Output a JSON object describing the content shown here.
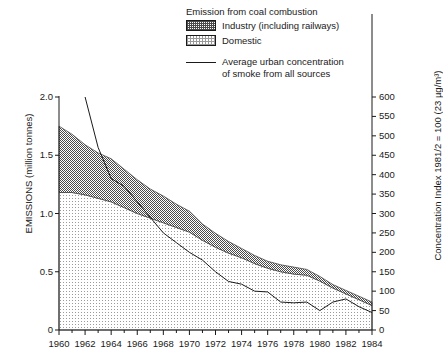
{
  "legend": {
    "title": "Emission from coal combustion",
    "items": [
      {
        "label": "Industry (including railways)",
        "swatch": "industry-pattern-swatch"
      },
      {
        "label": "Domestic",
        "swatch": "domestic-pattern-swatch"
      }
    ],
    "line_label_line1": "Average urban concentration",
    "line_label_line2": "of smoke from all sources"
  },
  "chart_data": {
    "type": "area",
    "title": "",
    "xlabel": "",
    "ylabel": "EMISSIONS (million tonnes)",
    "y2label": "Concentration Index 1981/2 = 100 (23 µg/m³)",
    "x": [
      1960,
      1961,
      1962,
      1963,
      1964,
      1965,
      1966,
      1967,
      1968,
      1969,
      1970,
      1971,
      1972,
      1973,
      1974,
      1975,
      1976,
      1977,
      1978,
      1979,
      1980,
      1981,
      1982,
      1983,
      1984
    ],
    "xlim": [
      1960,
      1984
    ],
    "ylim": [
      0,
      2.0
    ],
    "y2lim": [
      0,
      600
    ],
    "xticks": [
      1960,
      1962,
      1964,
      1966,
      1968,
      1970,
      1972,
      1974,
      1976,
      1978,
      1980,
      1982,
      1984
    ],
    "xtick_labels": [
      "1960",
      "1962",
      "1964",
      "1966",
      "1968",
      "1970",
      "1972",
      "1974",
      "1976",
      "1978",
      "1980",
      "1982",
      "1984"
    ],
    "x_minor_ticks": [
      1961,
      1963,
      1965,
      1967,
      1969,
      1971,
      1973,
      1975,
      1977,
      1979,
      1981,
      1983
    ],
    "yticks": [
      0,
      0.5,
      1.0,
      1.5,
      2.0
    ],
    "ytick_labels": [
      "0",
      "0.5",
      "1.0",
      "1.5",
      "2.0"
    ],
    "y2ticks": [
      0,
      50,
      100,
      150,
      200,
      250,
      300,
      350,
      400,
      450,
      500,
      550,
      600
    ],
    "y2tick_labels": [
      "0",
      "50",
      "100",
      "150",
      "200",
      "250",
      "300",
      "350",
      "400",
      "450",
      "500",
      "550",
      "600"
    ],
    "grid": false,
    "legend_position": "top-right",
    "stacked": true,
    "series": [
      {
        "name": "Domestic",
        "type": "area",
        "stack_order": 1,
        "fill": "light-dot-pattern",
        "values": [
          1.18,
          1.18,
          1.16,
          1.13,
          1.1,
          1.05,
          1.0,
          0.96,
          0.92,
          0.88,
          0.84,
          0.77,
          0.71,
          0.66,
          0.62,
          0.57,
          0.53,
          0.5,
          0.48,
          0.47,
          0.42,
          0.36,
          0.31,
          0.26,
          0.21
        ]
      },
      {
        "name": "Industry (including railways)",
        "type": "area",
        "stack_order": 2,
        "fill": "dark-dot-pattern",
        "values": [
          0.57,
          0.5,
          0.43,
          0.39,
          0.37,
          0.33,
          0.29,
          0.25,
          0.23,
          0.2,
          0.18,
          0.14,
          0.12,
          0.1,
          0.08,
          0.07,
          0.06,
          0.06,
          0.06,
          0.05,
          0.04,
          0.03,
          0.03,
          0.03,
          0.03
        ]
      },
      {
        "name": "Average urban concentration of smoke from all sources",
        "type": "line",
        "axis": "right",
        "x": [
          1962,
          1963,
          1964,
          1965,
          1966,
          1967,
          1968,
          1969,
          1970,
          1971,
          1972,
          1973,
          1974,
          1975,
          1976,
          1977,
          1978,
          1979,
          1980,
          1981,
          1982,
          1983,
          1984
        ],
        "values": [
          600,
          470,
          390,
          370,
          330,
          290,
          250,
          225,
          200,
          180,
          150,
          125,
          118,
          100,
          98,
          72,
          70,
          72,
          50,
          72,
          80,
          60,
          45
        ]
      }
    ]
  },
  "colors": {
    "axis": "#1a1a1a",
    "line": "#1a1a1a",
    "industry_fill": "#4a4a4a",
    "domestic_fill": "#9a9a9a",
    "background": "#ffffff"
  }
}
